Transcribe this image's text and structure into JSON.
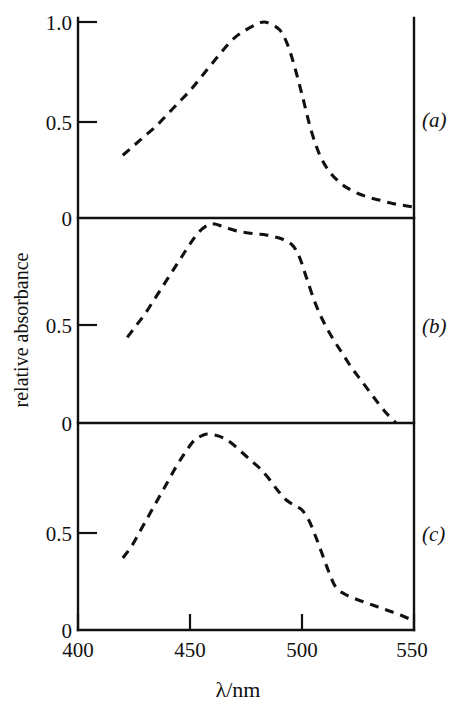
{
  "figure": {
    "ylabel": "relative absorbance",
    "xlabel": "λ/nm",
    "x_ticks": [
      "400",
      "450",
      "500",
      "550"
    ],
    "x_tick_values": [
      400,
      450,
      500,
      550
    ],
    "panel_a_label": "(a)",
    "panel_b_label": "(b)",
    "panel_c_label": "(c)",
    "panel_a_yticks": [
      "1.0",
      "0.5",
      "0"
    ],
    "panel_b_yticks": [
      "0",
      "0.5",
      "0"
    ],
    "panel_c_yticks": [
      "0",
      "0.5",
      "0"
    ],
    "line_color": "#111111",
    "background_color": "#ffffff"
  },
  "chart_data": {
    "type": "line",
    "title": "",
    "xlabel": "λ/nm",
    "ylabel": "relative absorbance",
    "xlim": [
      400,
      550
    ],
    "ylim": [
      0,
      1.0
    ],
    "grid": false,
    "legend": "none",
    "linestyle": "dashed",
    "panels": [
      {
        "name": "(a)",
        "yticks": [
          0,
          0.5,
          1.0
        ],
        "ytick_labels": [
          "0",
          "0.5",
          "1.0"
        ],
        "x": [
          420,
          425,
          430,
          435,
          440,
          445,
          450,
          455,
          460,
          465,
          470,
          475,
          480,
          483,
          486,
          490,
          493,
          496,
          500,
          504,
          508,
          512,
          516,
          520,
          525,
          530,
          535,
          540,
          545,
          550
        ],
        "y": [
          0.32,
          0.37,
          0.42,
          0.47,
          0.53,
          0.59,
          0.65,
          0.72,
          0.79,
          0.86,
          0.92,
          0.96,
          0.99,
          1.0,
          0.99,
          0.96,
          0.9,
          0.8,
          0.63,
          0.45,
          0.32,
          0.24,
          0.19,
          0.155,
          0.125,
          0.105,
          0.09,
          0.075,
          0.065,
          0.055
        ]
      },
      {
        "name": "(b)",
        "yticks": [
          0,
          0.5,
          1.0
        ],
        "ytick_labels": [
          "0",
          "0.5",
          "0"
        ],
        "x": [
          422,
          426,
          430,
          434,
          438,
          442,
          446,
          450,
          454,
          458,
          461,
          464,
          468,
          472,
          476,
          480,
          484,
          488,
          492,
          496,
          499,
          502,
          506,
          510,
          514,
          518,
          522,
          526,
          530,
          534,
          538,
          542
        ],
        "y": [
          0.43,
          0.49,
          0.55,
          0.62,
          0.69,
          0.76,
          0.83,
          0.9,
          0.96,
          0.995,
          1.0,
          0.99,
          0.975,
          0.962,
          0.955,
          0.95,
          0.945,
          0.935,
          0.92,
          0.89,
          0.83,
          0.73,
          0.6,
          0.5,
          0.42,
          0.35,
          0.28,
          0.22,
          0.16,
          0.1,
          0.045,
          0.0
        ]
      },
      {
        "name": "(c)",
        "yticks": [
          0,
          0.5,
          1.0
        ],
        "ytick_labels": [
          "0",
          "0.5",
          "0"
        ],
        "x": [
          420,
          424,
          428,
          432,
          436,
          440,
          444,
          448,
          452,
          456,
          458,
          461,
          465,
          469,
          473,
          477,
          481,
          485,
          489,
          493,
          497,
          500,
          503,
          506,
          509,
          512,
          515,
          519,
          524,
          529,
          534,
          539,
          544,
          550
        ],
        "y": [
          0.36,
          0.42,
          0.5,
          0.58,
          0.66,
          0.74,
          0.82,
          0.89,
          0.95,
          0.975,
          0.98,
          0.975,
          0.96,
          0.93,
          0.89,
          0.85,
          0.81,
          0.76,
          0.7,
          0.65,
          0.62,
          0.6,
          0.55,
          0.47,
          0.38,
          0.29,
          0.215,
          0.18,
          0.155,
          0.135,
          0.115,
          0.095,
          0.075,
          0.045
        ]
      }
    ]
  }
}
